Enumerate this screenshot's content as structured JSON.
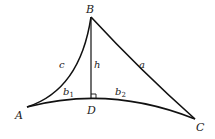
{
  "diagram": {
    "type": "curved-triangle-with-altitude",
    "colors": {
      "stroke": "#111111",
      "text": "#222222",
      "background": "#ffffff"
    },
    "vertices": {
      "A": {
        "label": "A"
      },
      "B": {
        "label": "B"
      },
      "C": {
        "label": "C"
      },
      "D": {
        "label": "D"
      }
    },
    "sides": {
      "a": {
        "label": "a"
      },
      "c": {
        "label": "c"
      },
      "h": {
        "label": "h"
      },
      "b1": {
        "label": "b",
        "subscript": "1"
      },
      "b2": {
        "label": "b",
        "subscript": "2"
      }
    },
    "right_angle_at": "D"
  }
}
